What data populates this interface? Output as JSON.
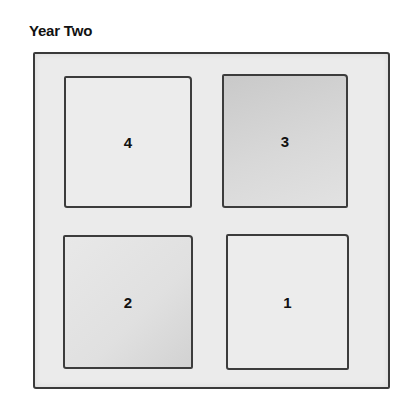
{
  "title": "Year Two",
  "beds": [
    {
      "label": "4",
      "position": "top-left",
      "shade": "light"
    },
    {
      "label": "3",
      "position": "top-right",
      "shade": "dark"
    },
    {
      "label": "2",
      "position": "bottom-left",
      "shade": "medium"
    },
    {
      "label": "1",
      "position": "bottom-right",
      "shade": "light"
    }
  ]
}
